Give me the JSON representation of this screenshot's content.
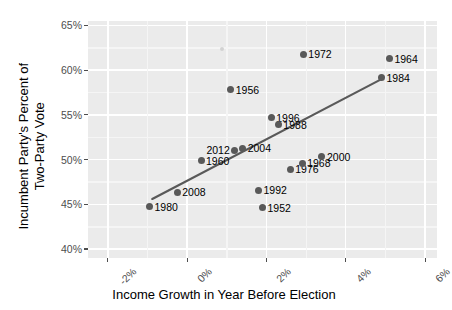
{
  "chart_data": {
    "type": "scatter",
    "title": "",
    "xlabel": "Income Growth in Year Before Election",
    "ylabel_line1": "Incumbent Party's Percent of",
    "ylabel_line2": "Two-Party Vote",
    "xlim": [
      -2.5,
      6.3
    ],
    "ylim": [
      39.0,
      65.5
    ],
    "xticks": [
      -2,
      0,
      2,
      4,
      6
    ],
    "xticklabels": [
      "-2%",
      "0%",
      "2%",
      "4%",
      "6%"
    ],
    "yticks": [
      40,
      45,
      50,
      55,
      60,
      65
    ],
    "yticklabels": [
      "40%",
      "45%",
      "50%",
      "55%",
      "60%",
      "65%"
    ],
    "grid": true,
    "legend": "none",
    "point_color": "#595959",
    "panel_color": "#ebebeb",
    "gridline_color": "#ffffff",
    "trendline_color": "#595959",
    "points": [
      {
        "label": "1980",
        "x": -0.95,
        "y": 44.75,
        "label_side": "right"
      },
      {
        "label": "2008",
        "x": -0.25,
        "y": 46.35,
        "label_side": "right"
      },
      {
        "label": "1960",
        "x": 0.35,
        "y": 49.9,
        "label_side": "right"
      },
      {
        "label": "1956",
        "x": 1.1,
        "y": 57.8,
        "label_side": "right"
      },
      {
        "label": "2012",
        "x": 1.2,
        "y": 51.05,
        "label_side": "left"
      },
      {
        "label": "2004",
        "x": 1.4,
        "y": 51.25,
        "label_side": "right"
      },
      {
        "label": "1992",
        "x": 1.8,
        "y": 46.6,
        "label_side": "right"
      },
      {
        "label": "1952",
        "x": 1.9,
        "y": 44.6,
        "label_side": "right"
      },
      {
        "label": "1996",
        "x": 2.12,
        "y": 54.7,
        "label_side": "right"
      },
      {
        "label": "1988",
        "x": 2.3,
        "y": 53.9,
        "label_side": "right"
      },
      {
        "label": "1976",
        "x": 2.6,
        "y": 48.95,
        "label_side": "right"
      },
      {
        "label": "1968",
        "x": 2.9,
        "y": 49.6,
        "label_side": "right"
      },
      {
        "label": "1972",
        "x": 2.93,
        "y": 61.8,
        "label_side": "right"
      },
      {
        "label": "2000",
        "x": 3.4,
        "y": 50.3,
        "label_side": "right"
      },
      {
        "label": "1984",
        "x": 4.9,
        "y": 59.15,
        "label_side": "right"
      },
      {
        "label": "1964",
        "x": 5.1,
        "y": 61.3,
        "label_side": "right"
      }
    ],
    "faint_points": [
      {
        "x": 0.88,
        "y": 62.35
      }
    ],
    "trendline": {
      "x0": -0.88,
      "y0": 45.6,
      "x1": 4.9,
      "y1": 59.0
    }
  }
}
